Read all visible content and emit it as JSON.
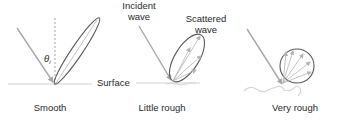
{
  "figure": {
    "panels": [
      {
        "id": "smooth",
        "caption": "Smooth"
      },
      {
        "id": "little-rough",
        "caption": "Little rough"
      },
      {
        "id": "very-rough",
        "caption": "Very rough"
      }
    ],
    "labels": {
      "angle": "θ",
      "angle_sub": "i",
      "surface": "Surface",
      "incident_line1": "Incident",
      "incident_line2": "wave",
      "scattered_line1": "Scattered",
      "scattered_line2": "wave"
    },
    "colors": {
      "incident": "#a8a8a8",
      "lobe": "#5a5a5a",
      "arrows": "#b4b4b4",
      "surface": "#d4d4d4",
      "text": "#2a2a2a"
    }
  }
}
